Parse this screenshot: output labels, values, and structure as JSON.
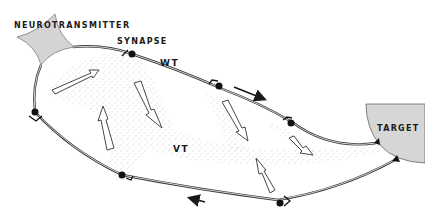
{
  "diagram": {
    "labels": {
      "neurotransmitter": "NEUROTRANSMITTER",
      "synapse": "SYNAPSE",
      "wt": "WT",
      "vt": "VT",
      "target": "TARGET"
    },
    "colors": {
      "background": "#ffffff",
      "cell_fill": "#d4d4d4",
      "line": "#333333",
      "stipple": "#8a8a8a",
      "text": "#1a1a1a"
    },
    "nodes": [
      {
        "id": "neurotransmitter-cell",
        "label_key": "neurotransmitter"
      },
      {
        "id": "target-cell",
        "label_key": "target"
      },
      {
        "id": "synapse-1"
      },
      {
        "id": "synapse-2"
      },
      {
        "id": "synapse-3"
      },
      {
        "id": "synapse-4"
      },
      {
        "id": "synapse-5"
      },
      {
        "id": "synapse-6"
      }
    ],
    "flow_arrows": [
      {
        "id": "wt-direction",
        "direction": "right"
      },
      {
        "id": "return-direction",
        "direction": "left"
      }
    ]
  }
}
